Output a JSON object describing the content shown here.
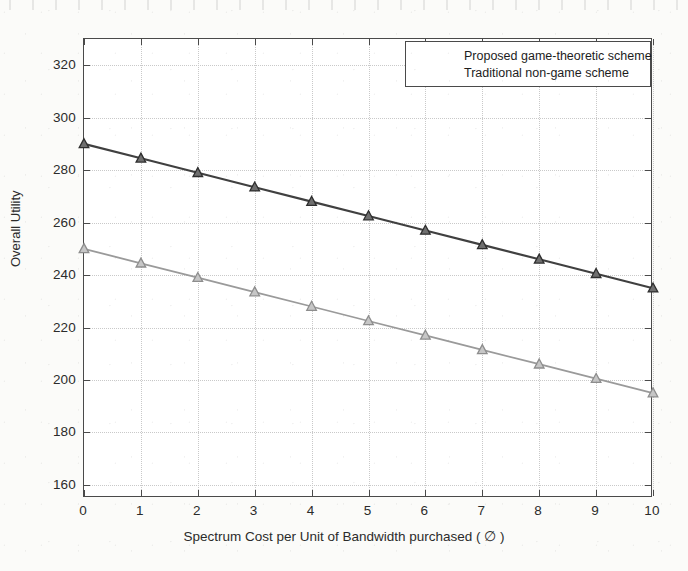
{
  "chart_data": {
    "type": "line",
    "title": "",
    "xlabel": "Spectrum Cost per Unit of Bandwidth purchased ( ∅ )",
    "ylabel": "Overall Utility",
    "x": [
      0,
      1,
      2,
      3,
      4,
      5,
      6,
      7,
      8,
      9,
      10
    ],
    "xlim": [
      0,
      10
    ],
    "ylim": [
      155,
      330
    ],
    "xticks": [
      "0",
      "1",
      "2",
      "3",
      "4",
      "5",
      "6",
      "7",
      "8",
      "9",
      "10"
    ],
    "yticks": [
      "160",
      "180",
      "200",
      "220",
      "240",
      "260",
      "280",
      "300",
      "320"
    ],
    "ytick_values": [
      160,
      180,
      200,
      220,
      240,
      260,
      280,
      300,
      320
    ],
    "grid": true,
    "legend_position": "top-right",
    "marker": "triangle-up",
    "series": [
      {
        "name": "Proposed game-theoretic scheme",
        "color": "#404040",
        "values": [
          290,
          284.5,
          279,
          273.5,
          268,
          262.5,
          257,
          251.5,
          246,
          240.5,
          235
        ]
      },
      {
        "name": "Traditional non-game scheme",
        "color": "#9a9a9a",
        "values": [
          250,
          244.5,
          239,
          233.5,
          228,
          222.5,
          217,
          211.5,
          206,
          200.5,
          195
        ]
      }
    ]
  },
  "legend": {
    "items": [
      {
        "label": "Proposed game-theoretic scheme"
      },
      {
        "label": "Traditional non-game scheme"
      }
    ]
  },
  "axes": {
    "y_title": "Overall Utility",
    "x_title": "Spectrum Cost per Unit of Bandwidth purchased ( ∅ )"
  },
  "colors": {
    "series_primary": "#404040",
    "series_secondary": "#9a9a9a",
    "axis": "#4a4a4a",
    "grid": "#c9c9c9",
    "background": "#ffffff",
    "page": "#fbfbf9"
  }
}
